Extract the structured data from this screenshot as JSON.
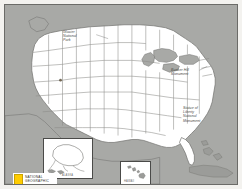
{
  "figure": {
    "kind": "map",
    "region": "United States",
    "frame_color": "#6b6b68",
    "land_color": "#ffffff",
    "water_color": "#a8a9a6",
    "foreign_land_color": "#a8a9a6",
    "border_color": "#6f6f6c",
    "background_color": "#f3f2ef"
  },
  "labels": {
    "glacier": "Glacier\nNational\nPark",
    "bunker_hill": "Bunker Hill\nMonument",
    "statue_of_liberty": "Statue of\nLiberty\nNational\nMonument"
  },
  "insets": {
    "alaska": {
      "label": "ALASKA"
    },
    "hawaii": {
      "label": "HAWAII"
    }
  },
  "logo": {
    "line1": "NATIONAL",
    "line2": "GEOGRAPHIC",
    "rect_color": "#ffcc00"
  }
}
